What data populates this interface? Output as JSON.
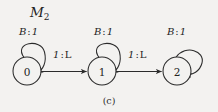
{
  "figure": {
    "machine_title": "M",
    "machine_subscript": "2",
    "caption": "(c)",
    "background_color": "#f3f2f0",
    "ink_color": "#2b2b2b"
  },
  "states": [
    {
      "label": "0",
      "name": "state-0",
      "cx": 27,
      "cy": 71,
      "r": 14
    },
    {
      "label": "1",
      "name": "state-1",
      "cx": 102,
      "cy": 71,
      "r": 14
    },
    {
      "label": "2",
      "name": "state-2",
      "cx": 177,
      "cy": 71,
      "r": 14
    }
  ],
  "self_loops": [
    {
      "state": "0",
      "label_input": "B",
      "label_colon": ":",
      "label_output": "1"
    },
    {
      "state": "1",
      "label_input": "B",
      "label_colon": ":",
      "label_output": "1"
    },
    {
      "state": "2",
      "label_input": "B",
      "label_colon": ":",
      "label_output": "1"
    }
  ],
  "transitions": [
    {
      "from": "0",
      "to": "1",
      "label_input": "1",
      "label_colon": ":",
      "label_output": "L"
    },
    {
      "from": "1",
      "to": "2",
      "label_input": "1",
      "label_colon": ":",
      "label_output": "L"
    }
  ]
}
